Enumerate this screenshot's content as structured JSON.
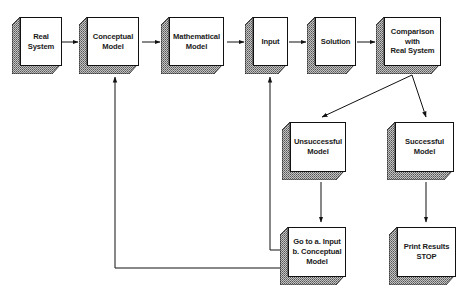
{
  "diagram": {
    "type": "flowchart",
    "nodes": [
      {
        "id": "real_system",
        "label": "Real\nSystem"
      },
      {
        "id": "conceptual_model",
        "label": "Conceptual\nModel"
      },
      {
        "id": "mathematical_model",
        "label": "Mathematical\nModel"
      },
      {
        "id": "input",
        "label": "Input"
      },
      {
        "id": "solution",
        "label": "Solution"
      },
      {
        "id": "comparison",
        "label": "Comparison\nwith\nReal  System"
      },
      {
        "id": "unsuccessful_model",
        "label": "Unsuccessful\nModel"
      },
      {
        "id": "successful_model",
        "label": "Successful\nModel"
      },
      {
        "id": "go_to",
        "label": "Go to  a.  Input\nb.  Conceptual\nModel"
      },
      {
        "id": "print_results",
        "label": "Print  Results\nSTOP"
      }
    ],
    "edges": [
      {
        "from": "real_system",
        "to": "conceptual_model"
      },
      {
        "from": "conceptual_model",
        "to": "mathematical_model"
      },
      {
        "from": "mathematical_model",
        "to": "input"
      },
      {
        "from": "input",
        "to": "solution"
      },
      {
        "from": "solution",
        "to": "comparison"
      },
      {
        "from": "comparison",
        "to": "unsuccessful_model"
      },
      {
        "from": "comparison",
        "to": "successful_model"
      },
      {
        "from": "unsuccessful_model",
        "to": "go_to"
      },
      {
        "from": "successful_model",
        "to": "print_results"
      },
      {
        "from": "go_to",
        "to": "input",
        "label": "a"
      },
      {
        "from": "go_to",
        "to": "conceptual_model",
        "label": "b"
      }
    ],
    "colors": {
      "line": "#111111",
      "face": "#ffffff",
      "shadow": "#9a9a9a"
    }
  }
}
